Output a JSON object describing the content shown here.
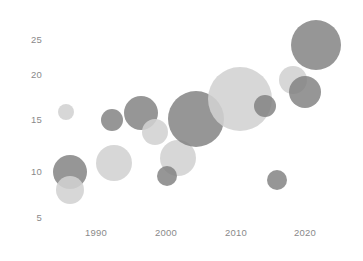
{
  "chart_data": {
    "type": "scatter",
    "title": "",
    "subtitle": "",
    "xlabel": "",
    "ylabel": "",
    "xlim": [
      1984,
      2026
    ],
    "ylim": [
      4,
      27
    ],
    "grid": false,
    "legend": null,
    "xticks": [
      1990,
      2000,
      2010,
      2020
    ],
    "yticks": [
      5,
      10,
      15,
      20,
      25
    ],
    "xtick_labels": [
      "1990",
      "2000",
      "2010",
      "2020"
    ],
    "ytick_labels": [
      "5",
      "10",
      "15",
      "20",
      "25"
    ],
    "marker": "bubble",
    "colors": {
      "dark": "#7f7f7f",
      "light": "#d2d2d2",
      "tick_text": "#8a8a8a",
      "background": "#ffffff"
    },
    "series": [
      {
        "name": "dark",
        "color": "#7f7f7f",
        "points": [
          {
            "x": 1986.5,
            "y": 9.8,
            "size": 34,
            "label": ""
          },
          {
            "x": 1992.5,
            "y": 15.8,
            "size": 21,
            "label": ""
          },
          {
            "x": 1995.6,
            "y": 16.6,
            "size": 33,
            "label": ""
          },
          {
            "x": 2001.0,
            "y": 9.9,
            "size": 20,
            "label": ""
          },
          {
            "x": 2003.8,
            "y": 16.4,
            "size": 55,
            "label": ""
          },
          {
            "x": 2013.4,
            "y": 17.8,
            "size": 22,
            "label": ""
          },
          {
            "x": 2016.4,
            "y": 9.4,
            "size": 20,
            "label": ""
          },
          {
            "x": 2019.8,
            "y": 18.6,
            "size": 31,
            "label": ""
          },
          {
            "x": 2021.8,
            "y": 24.6,
            "size": 50,
            "label": ""
          }
        ]
      },
      {
        "name": "light",
        "color": "#d2d2d2",
        "points": [
          {
            "x": 1985.5,
            "y": 17.0,
            "size": 16,
            "label": ""
          },
          {
            "x": 1986.5,
            "y": 7.3,
            "size": 27,
            "label": ""
          },
          {
            "x": 1990.0,
            "y": 11.0,
            "size": 35,
            "label": ""
          },
          {
            "x": 1997.4,
            "y": 14.3,
            "size": 26,
            "label": ""
          },
          {
            "x": 2002.6,
            "y": 11.9,
            "size": 36,
            "label": ""
          },
          {
            "x": 2009.5,
            "y": 19.7,
            "size": 64,
            "label": ""
          },
          {
            "x": 2019.0,
            "y": 20.0,
            "size": 28,
            "label": ""
          }
        ]
      }
    ]
  },
  "geometry": {
    "width": 363,
    "height": 261,
    "bubbles": [
      {
        "id": "light-1985-17",
        "cx": 66,
        "cy": 112,
        "r": 8,
        "tone": "light"
      },
      {
        "id": "dark-1986-10",
        "cx": 70,
        "cy": 172,
        "r": 17,
        "tone": "dark"
      },
      {
        "id": "light-1986-7",
        "cx": 70,
        "cy": 190,
        "r": 14,
        "tone": "light"
      },
      {
        "id": "light-1990-11",
        "cx": 114,
        "cy": 163,
        "r": 18,
        "tone": "light"
      },
      {
        "id": "dark-1992-16",
        "cx": 112,
        "cy": 120,
        "r": 11,
        "tone": "dark"
      },
      {
        "id": "dark-1996-17",
        "cx": 141,
        "cy": 113,
        "r": 17,
        "tone": "dark"
      },
      {
        "id": "light-1997-14",
        "cx": 155,
        "cy": 132,
        "r": 13,
        "tone": "light"
      },
      {
        "id": "light-2003-12",
        "cx": 178,
        "cy": 158,
        "r": 18,
        "tone": "light"
      },
      {
        "id": "dark-2001-10",
        "cx": 167,
        "cy": 176,
        "r": 10,
        "tone": "dark"
      },
      {
        "id": "dark-2004-16",
        "cx": 196,
        "cy": 119,
        "r": 28,
        "tone": "dark"
      },
      {
        "id": "light-2010-20",
        "cx": 240,
        "cy": 99,
        "r": 32,
        "tone": "light"
      },
      {
        "id": "dark-2013-18",
        "cx": 265,
        "cy": 106,
        "r": 11,
        "tone": "dark"
      },
      {
        "id": "dark-2016-9",
        "cx": 277,
        "cy": 180,
        "r": 10,
        "tone": "dark"
      },
      {
        "id": "light-2019-20",
        "cx": 293,
        "cy": 80,
        "r": 14,
        "tone": "light"
      },
      {
        "id": "dark-2020-19",
        "cx": 305,
        "cy": 92,
        "r": 16,
        "tone": "dark"
      },
      {
        "id": "dark-2022-25",
        "cx": 316,
        "cy": 45,
        "r": 25,
        "tone": "dark"
      }
    ],
    "y_axis": [
      {
        "label": "25",
        "px": 40
      },
      {
        "label": "20",
        "px": 75
      },
      {
        "label": "15",
        "px": 120
      },
      {
        "label": "10",
        "px": 172
      },
      {
        "label": "5",
        "px": 218
      }
    ],
    "x_axis": [
      {
        "label": "1990",
        "px": 96
      },
      {
        "label": "2000",
        "px": 166
      },
      {
        "label": "2010",
        "px": 236
      },
      {
        "label": "2020",
        "px": 305
      }
    ]
  }
}
